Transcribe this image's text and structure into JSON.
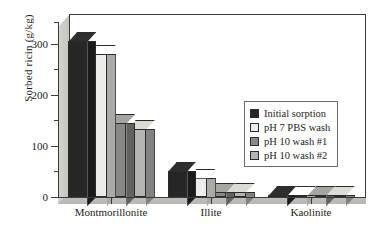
{
  "chart_data": {
    "type": "bar",
    "title": "",
    "subtitle": "",
    "xlabel": "",
    "ylabel": "Sorbed ricin (g/kg)",
    "categories": [
      "Montmorillonite",
      "Illite",
      "Kaolinite"
    ],
    "series": [
      {
        "name": "Initial sorption",
        "values": [
          312,
          53,
          3
        ],
        "color": "#262626"
      },
      {
        "name": "pH 7 PBS wash",
        "values": [
          286,
          39,
          3
        ],
        "color": "#ececea"
      },
      {
        "name": "pH 10 wash #1",
        "values": [
          148,
          10,
          3
        ],
        "color": "#888884"
      },
      {
        "name": "pH 10 wash #2",
        "values": [
          136,
          10,
          3
        ],
        "color": "#b4b4b0"
      }
    ],
    "ylim": [
      0,
      350
    ],
    "yticks": [
      0,
      100,
      200,
      300
    ],
    "ytick_labels": [
      "0",
      "100",
      "200",
      "300"
    ],
    "yminor_ticks": [
      50,
      150,
      250,
      350
    ],
    "grid": false,
    "legend_position": "center-right",
    "style": "3d-bar",
    "axis_color": "#3a3a3a"
  },
  "axes": {
    "y_title": "Sorbed ricin (g/kg)",
    "tick_labels": [
      "300",
      "200",
      "100",
      "0"
    ],
    "category_labels": [
      "Montmorillonite",
      "Illite",
      "Kaolinite"
    ]
  },
  "legend": {
    "items": [
      {
        "label": "Initial sorption",
        "color": "#262626"
      },
      {
        "label": "pH 7 PBS wash",
        "color": "#ececea"
      },
      {
        "label": "pH 10 wash #1",
        "color": "#888884"
      },
      {
        "label": "pH 10 wash #2",
        "color": "#b4b4b0"
      }
    ]
  }
}
